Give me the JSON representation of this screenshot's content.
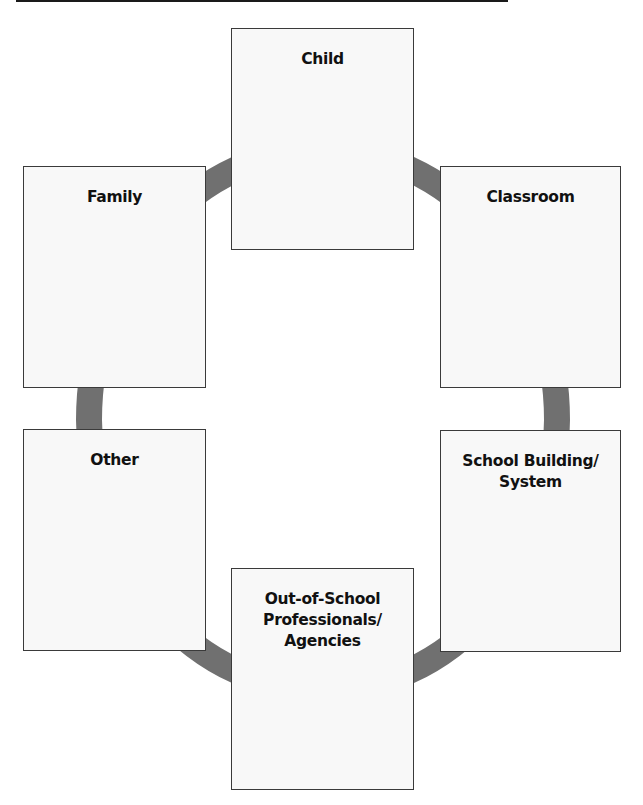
{
  "diagram": {
    "ring_color": "#707070",
    "box_border_color": "#3a3a3a",
    "box_fill_color": "#f8f8f8",
    "boxes": [
      {
        "id": "child",
        "label": "Child"
      },
      {
        "id": "family",
        "label": "Family"
      },
      {
        "id": "classroom",
        "label": "Classroom"
      },
      {
        "id": "other",
        "label": "Other"
      },
      {
        "id": "school-building",
        "label": "School Building/\nSystem"
      },
      {
        "id": "out-of-school",
        "label": "Out-of-School\nProfessionals/\nAgencies"
      }
    ]
  }
}
